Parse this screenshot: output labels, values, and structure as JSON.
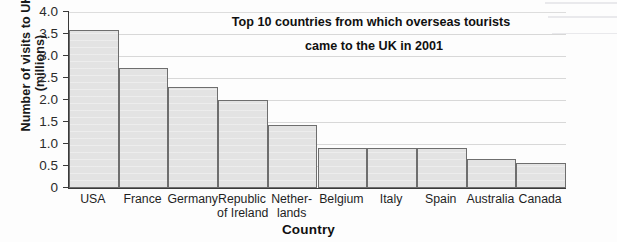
{
  "chart_data": {
    "type": "bar",
    "title": "Top 10 countries from which overseas tourists came to the UK in 2001",
    "title_line1": "Top 10 countries from which overseas tourists",
    "title_line2": "came to the UK in 2001",
    "xlabel": "Country",
    "ylabel": "Number of visits to UK (millions)",
    "ylabel_line1": "Number of visits to UK",
    "ylabel_line2": "(millions)",
    "categories": [
      "USA",
      "France",
      "Germany",
      "Republic of Ireland",
      "Netherlands",
      "Belgium",
      "Italy",
      "Spain",
      "Australia",
      "Canada"
    ],
    "category_lines": [
      [
        "USA"
      ],
      [
        "France"
      ],
      [
        "Germany"
      ],
      [
        "Republic",
        "of Ireland"
      ],
      [
        "Nether-",
        "lands"
      ],
      [
        "Belgium"
      ],
      [
        "Italy"
      ],
      [
        "Spain"
      ],
      [
        "Australia"
      ],
      [
        "Canada"
      ]
    ],
    "values": [
      3.58,
      2.73,
      2.29,
      2.0,
      1.43,
      0.91,
      0.91,
      0.91,
      0.67,
      0.56
    ],
    "ylim": [
      0,
      4.0
    ],
    "yticks": [
      0,
      0.5,
      1.0,
      1.5,
      2.0,
      2.5,
      3.0,
      3.5,
      4.0
    ],
    "ytick_labels": [
      "0",
      "0.5",
      "1.0",
      "1.5",
      "2.0",
      "2.5",
      "3.0",
      "3.5",
      "4.0"
    ],
    "grid": true,
    "legend": false,
    "bar_fill_color": "#e2e2e2",
    "bar_edge_color": "#6e6e6e",
    "axis_color": "#3a3a3a"
  }
}
